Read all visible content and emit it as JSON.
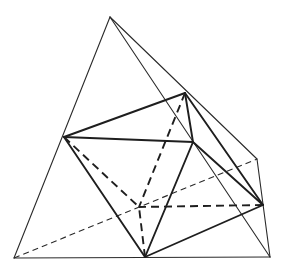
{
  "diagram": {
    "colors": {
      "line": "#1e1e1e",
      "background": "#ffffff"
    },
    "tetrahedron_vertices": {
      "A": [
        110,
        17
      ],
      "B": [
        14,
        258
      ],
      "C": [
        270,
        257
      ],
      "D": [
        257,
        159
      ]
    },
    "octahedron_vertices": {
      "P1": [
        64,
        137
      ],
      "P2": [
        185,
        93
      ],
      "P3": [
        193,
        142
      ],
      "P4": [
        263,
        205
      ],
      "P5": [
        145,
        257
      ],
      "P6": [
        139,
        207
      ]
    },
    "tetrahedron_edges": [
      {
        "from": "A",
        "to": "B",
        "style": "solid-thin"
      },
      {
        "from": "B",
        "to": "C",
        "style": "solid-thin"
      },
      {
        "from": "A",
        "to": "C",
        "style": "solid-thin"
      },
      {
        "from": "A",
        "to": "D",
        "style": "solid-thin"
      },
      {
        "from": "C",
        "to": "D",
        "style": "solid-thin"
      },
      {
        "from": "B",
        "to": "D",
        "style": "dashed-thin"
      }
    ],
    "octahedron_edges": [
      {
        "from": "P1",
        "to": "P2",
        "style": "solid-thick"
      },
      {
        "from": "P1",
        "to": "P3",
        "style": "solid-thick"
      },
      {
        "from": "P1",
        "to": "P5",
        "style": "solid-thick"
      },
      {
        "from": "P1",
        "to": "P6",
        "style": "dashed-thick"
      },
      {
        "from": "P2",
        "to": "P3",
        "style": "solid-thick"
      },
      {
        "from": "P2",
        "to": "P4",
        "style": "solid-thick"
      },
      {
        "from": "P2",
        "to": "P6",
        "style": "dashed-thick"
      },
      {
        "from": "P3",
        "to": "P4",
        "style": "solid-thick"
      },
      {
        "from": "P3",
        "to": "P5",
        "style": "solid-thick"
      },
      {
        "from": "P4",
        "to": "P5",
        "style": "solid-thick"
      },
      {
        "from": "P4",
        "to": "P6",
        "style": "dashed-thick"
      },
      {
        "from": "P5",
        "to": "P6",
        "style": "dashed-thick"
      }
    ]
  }
}
